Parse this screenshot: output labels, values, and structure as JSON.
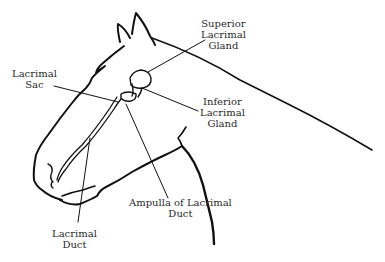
{
  "diagram": {
    "line_color": "#111111",
    "background": "#ffffff",
    "labels": [
      {
        "id": "superior-lacrimal-gland",
        "lines": [
          "Superior",
          "Lacrimal",
          "Gland"
        ]
      },
      {
        "id": "lacrimal-sac",
        "lines": [
          "Lacrimal",
          "Sac"
        ]
      },
      {
        "id": "inferior-lacrimal-gland",
        "lines": [
          "Inferior",
          "Lacrimal",
          "Gland"
        ]
      },
      {
        "id": "ampulla-of-lacrimal-duct",
        "lines": [
          "Ampulla of Lacrimal",
          "Duct"
        ]
      },
      {
        "id": "lacrimal-duct",
        "lines": [
          "Lacrimal",
          "Duct"
        ]
      }
    ]
  }
}
